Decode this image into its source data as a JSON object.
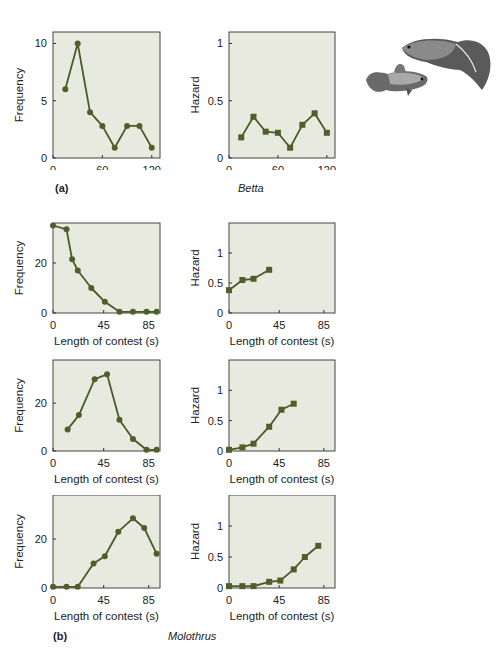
{
  "labels": {
    "panel_a": "(a)",
    "panel_b": "(b)",
    "species_a": "Betta",
    "species_b": "Molothrus"
  },
  "style": {
    "plot_bg": "#e8eadf",
    "plot_border": "#444444",
    "line_color": "#4a5a28",
    "marker_color": "#4f5f2a"
  },
  "chart_data": [
    {
      "id": "betta-frequency",
      "type": "line",
      "title": "",
      "xlabel": "Length of contest (s)",
      "ylabel": "Frequency",
      "xlim": [
        0,
        130
      ],
      "ylim": [
        0,
        11
      ],
      "xticks": [
        0,
        60,
        120
      ],
      "yticks": [
        0,
        5,
        10
      ],
      "marker": "circle",
      "x": [
        15,
        30,
        45,
        60,
        75,
        90,
        105,
        120
      ],
      "values": [
        6,
        10,
        4,
        2.8,
        0.9,
        2.8,
        2.8,
        0.9
      ]
    },
    {
      "id": "betta-hazard",
      "type": "line",
      "title": "",
      "xlabel": "Length of contest (s)",
      "ylabel": "Hazard",
      "xlim": [
        0,
        130
      ],
      "ylim": [
        0,
        1.1
      ],
      "xticks": [
        0,
        60,
        120
      ],
      "yticks": [
        0,
        0.5,
        1
      ],
      "marker": "square",
      "x": [
        15,
        30,
        45,
        60,
        75,
        90,
        105,
        120
      ],
      "values": [
        0.18,
        0.36,
        0.23,
        0.22,
        0.09,
        0.29,
        0.39,
        0.22
      ]
    },
    {
      "id": "molothrus-frequency-1",
      "type": "line",
      "xlabel": "Length of contest (s)",
      "ylabel": "Frequency",
      "xlim": [
        0,
        95
      ],
      "ylim": [
        0,
        36
      ],
      "xticks": [
        0,
        45,
        85
      ],
      "yticks": [
        0,
        20
      ],
      "marker": "circle",
      "x": [
        0,
        12,
        17,
        22,
        34,
        46,
        59,
        71,
        83,
        92
      ],
      "values": [
        35,
        33.5,
        21.5,
        17,
        10,
        4.5,
        0.5,
        0.5,
        0.5,
        0.5
      ]
    },
    {
      "id": "molothrus-hazard-1",
      "type": "line",
      "xlabel": "Length of contest (s)",
      "ylabel": "Hazard",
      "xlim": [
        0,
        95
      ],
      "ylim": [
        0,
        1.5
      ],
      "xticks": [
        0,
        45,
        85
      ],
      "yticks": [
        0,
        0.5,
        1
      ],
      "marker": "square",
      "x": [
        0,
        12,
        22,
        36
      ],
      "values": [
        0.38,
        0.55,
        0.57,
        0.72
      ]
    },
    {
      "id": "molothrus-frequency-2",
      "type": "line",
      "xlabel": "Length of contest (s)",
      "ylabel": "Frequency",
      "xlim": [
        0,
        95
      ],
      "ylim": [
        0,
        38
      ],
      "xticks": [
        0,
        45,
        85
      ],
      "yticks": [
        0,
        20
      ],
      "marker": "circle",
      "x": [
        13,
        23,
        37,
        48,
        59,
        71,
        83,
        92
      ],
      "values": [
        9,
        15,
        30,
        32,
        13,
        5,
        0.5,
        0.5
      ]
    },
    {
      "id": "molothrus-hazard-2",
      "type": "line",
      "xlabel": "Length of contest (s)",
      "ylabel": "Hazard",
      "xlim": [
        0,
        95
      ],
      "ylim": [
        0,
        1.5
      ],
      "xticks": [
        0,
        45,
        85
      ],
      "yticks": [
        0,
        0.5,
        1
      ],
      "marker": "square",
      "x": [
        0,
        12,
        22,
        36,
        47,
        58
      ],
      "values": [
        0.02,
        0.06,
        0.12,
        0.4,
        0.68,
        0.78
      ]
    },
    {
      "id": "molothrus-frequency-3",
      "type": "line",
      "xlabel": "Length of contest (s)",
      "ylabel": "Frequency",
      "xlim": [
        0,
        95
      ],
      "ylim": [
        0,
        38
      ],
      "xticks": [
        0,
        45,
        85
      ],
      "yticks": [
        0,
        20
      ],
      "marker": "circle",
      "x": [
        0,
        12,
        22,
        36,
        46,
        58,
        71,
        81,
        92
      ],
      "values": [
        0.5,
        0.5,
        0.5,
        10,
        13,
        23,
        28.5,
        24.5,
        14
      ]
    },
    {
      "id": "molothrus-hazard-3",
      "type": "line",
      "xlabel": "Length of contest (s)",
      "ylabel": "Hazard",
      "xlim": [
        0,
        95
      ],
      "ylim": [
        0,
        1.5
      ],
      "xticks": [
        0,
        45,
        85
      ],
      "yticks": [
        0,
        0.5,
        1
      ],
      "marker": "square",
      "x": [
        0,
        12,
        22,
        36,
        46,
        58,
        68,
        80
      ],
      "values": [
        0.03,
        0.03,
        0.03,
        0.1,
        0.12,
        0.3,
        0.5,
        0.68
      ]
    }
  ]
}
